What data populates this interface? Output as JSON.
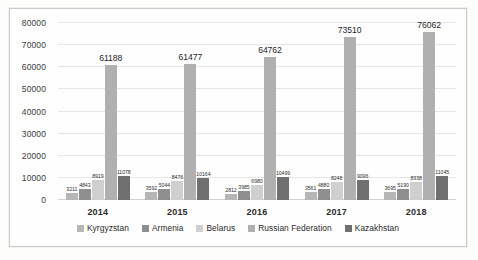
{
  "chart_data": {
    "type": "bar",
    "title": "",
    "subtitle": "",
    "xlabel": "",
    "ylabel": "",
    "categories": [
      "2014",
      "2015",
      "2016",
      "2017",
      "2018"
    ],
    "series": [
      {
        "name": "Kyrgyzstan",
        "color": "#b6b6b6",
        "values": [
          3211,
          3592,
          2812,
          3561,
          3695
        ]
      },
      {
        "name": "Armenia",
        "color": "#8f8f8f",
        "values": [
          4843,
          5044,
          3985,
          4880,
          5190
        ]
      },
      {
        "name": "Belarus",
        "color": "#cfcfcf",
        "values": [
          8919,
          8476,
          6980,
          8248,
          8338
        ]
      },
      {
        "name": "Russian Federation",
        "color": "#b0b0b0",
        "values": [
          61188,
          61477,
          64762,
          73510,
          76062
        ]
      },
      {
        "name": "Kazakhstan",
        "color": "#6f6f6f",
        "values": [
          11078,
          10164,
          10499,
          9096,
          11045
        ]
      }
    ],
    "ylim": [
      0,
      80000
    ],
    "yticks": [
      "0",
      "10000",
      "20000",
      "30000",
      "40000",
      "50000",
      "60000",
      "70000",
      "80000"
    ],
    "ytick_values": [
      0,
      10000,
      20000,
      30000,
      40000,
      50000,
      60000,
      70000,
      80000
    ],
    "grid": true,
    "legend_position": "bottom",
    "data_labels": true
  },
  "legend": {
    "items": [
      {
        "label": "Kyrgyzstan",
        "color": "#b6b6b6"
      },
      {
        "label": "Armenia",
        "color": "#8f8f8f"
      },
      {
        "label": "Belarus",
        "color": "#cfcfcf"
      },
      {
        "label": "Russian Federation",
        "color": "#b0b0b0"
      },
      {
        "label": "Kazakhstan",
        "color": "#6f6f6f"
      }
    ]
  }
}
